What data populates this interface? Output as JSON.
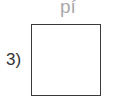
{
  "exercise": {
    "top_label": "pí",
    "number_label": "3)",
    "answer_box": ""
  }
}
